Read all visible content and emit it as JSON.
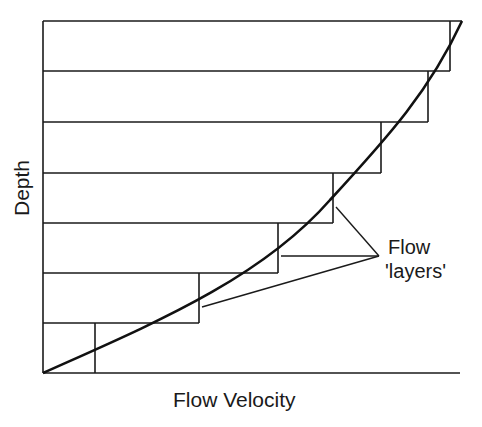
{
  "diagram": {
    "type": "velocity-profile",
    "xlabel": "Flow Velocity",
    "ylabel": "Depth",
    "annotation": {
      "line1": "Flow",
      "line2": "'layers'"
    },
    "layers": [
      {
        "index": 1,
        "top_y": 21,
        "bottom_y": 71,
        "right_x": 450
      },
      {
        "index": 2,
        "top_y": 71,
        "bottom_y": 122,
        "right_x": 428
      },
      {
        "index": 3,
        "top_y": 122,
        "bottom_y": 173,
        "right_x": 381
      },
      {
        "index": 4,
        "top_y": 173,
        "bottom_y": 223,
        "right_x": 333
      },
      {
        "index": 5,
        "top_y": 223,
        "bottom_y": 273,
        "right_x": 278
      },
      {
        "index": 6,
        "top_y": 273,
        "bottom_y": 323,
        "right_x": 199
      },
      {
        "index": 7,
        "top_y": 323,
        "bottom_y": 373,
        "right_x": 95
      }
    ],
    "colors": {
      "line": "#1a1a1a",
      "background": "#ffffff"
    }
  }
}
